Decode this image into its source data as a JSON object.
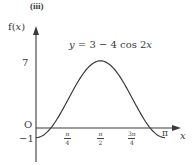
{
  "part_label": "(iii)",
  "chart_data": {
    "type": "line",
    "title": "",
    "equation_label": "y = 3 − 4 cos 2x",
    "xlabel": "x",
    "ylabel": "f(x)",
    "origin_label": "O",
    "x_ticks": [
      {
        "value": 0.7854,
        "num": "π",
        "den": "4"
      },
      {
        "value": 1.5708,
        "num": "π",
        "den": "2"
      },
      {
        "value": 2.3562,
        "num": "3π",
        "den": "4"
      },
      {
        "value": 3.1416,
        "label": "π"
      }
    ],
    "y_ticks": [
      {
        "value": 7,
        "label": "7"
      },
      {
        "value": -1,
        "label": "−1"
      }
    ],
    "xlim": [
      0,
      3.1416
    ],
    "ylim": [
      -1,
      7
    ],
    "series": [
      {
        "name": "y = 3 − 4 cos 2x",
        "x": [
          0,
          0.3927,
          0.5236,
          0.7854,
          1.0472,
          1.1781,
          1.5708,
          1.9635,
          2.0944,
          2.3562,
          2.618,
          2.7489,
          3.1416
        ],
        "values": [
          -1,
          0.17,
          1,
          3,
          5,
          5.83,
          7,
          5.83,
          5,
          3,
          1,
          0.17,
          -1
        ]
      }
    ],
    "grid": false,
    "legend": "none"
  },
  "labels": {
    "ylabel_f": "f(",
    "ylabel_x": "x",
    "ylabel_close": ")",
    "eq_y": "y",
    "eq_mid": " = 3 − 4 cos 2",
    "eq_x": "x",
    "xlabel": "x",
    "origin": "O",
    "y7": "7",
    "yneg1": "−1",
    "t1_num": "π",
    "t1_den": "4",
    "t2_num": "π",
    "t2_den": "2",
    "t3_num": "3π",
    "t3_den": "4",
    "t4": "π"
  }
}
